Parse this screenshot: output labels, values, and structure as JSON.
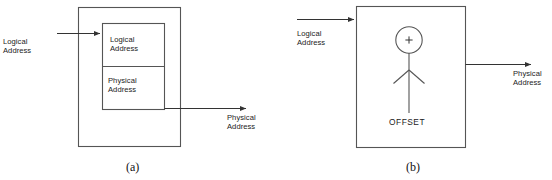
{
  "figure": {
    "title_caption_a": "(a)",
    "title_caption_b": "(b)",
    "stroke_color": "#555555",
    "text_color": "#1b1b1b",
    "background": "#ffffff"
  },
  "panel_a": {
    "caption": "(a)",
    "input_label_line1": "Logical",
    "input_label_line2": "Address",
    "output_label_line1": "Physical",
    "output_label_line2": "Address",
    "inner_top_label_line1": "Logical",
    "inner_top_label_line2": "Address",
    "inner_bottom_label_line1": "Physical",
    "inner_bottom_label_line2": "Address"
  },
  "panel_b": {
    "caption": "(b)",
    "input_label_line1": "Logical",
    "input_label_line2": "Address",
    "output_label_line1": "Physical",
    "output_label_line2": "Address",
    "adder_symbol": "+",
    "offset_label": "OFFSET"
  }
}
